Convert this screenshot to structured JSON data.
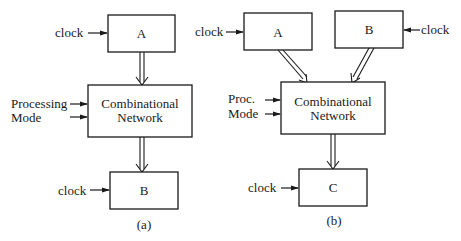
{
  "diagram_a": {
    "caption": "(a)",
    "register_top": {
      "label": "A",
      "clock_label": "clock"
    },
    "network": {
      "line1": "Combinational",
      "line2": "Network"
    },
    "mode_inputs": {
      "line1": "Processing",
      "line2": "Mode"
    },
    "register_bottom": {
      "label": "B",
      "clock_label": "clock"
    }
  },
  "diagram_b": {
    "caption": "(b)",
    "register_left": {
      "label": "A",
      "clock_label": "clock"
    },
    "register_right": {
      "label": "B",
      "clock_label": "clock"
    },
    "network": {
      "line1": "Combinational",
      "line2": "Network"
    },
    "mode_inputs": {
      "line1": "Proc.",
      "line2": "Mode"
    },
    "register_bottom": {
      "label": "C",
      "clock_label": "clock"
    }
  },
  "colors": {
    "line": "#1a1a1a",
    "background": "#ffffff"
  }
}
